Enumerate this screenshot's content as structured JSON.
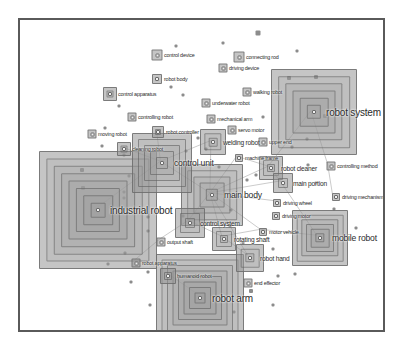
{
  "figure": {
    "type": "network-density-map",
    "title": "",
    "border_color": "#5a5a5a",
    "background_color": "#ffffff",
    "node_fill_color": "#969696",
    "node_outline_color": "#696969",
    "label_color": "#2b2b2b",
    "marker_color": "#787878",
    "link_color": "#b4b4b4"
  },
  "chart_data": {
    "type": "scatter",
    "title": "",
    "xlabel": "",
    "ylabel": "",
    "grid": false,
    "legend": "none",
    "xlim": [
      0,
      367
    ],
    "ylim": [
      0,
      314
    ],
    "nodes": [
      {
        "label": "industrial robot",
        "x": 78,
        "y": 190,
        "size": 118,
        "rings": 7,
        "label_size": "xl",
        "label_dx": 12,
        "label_dy": 0
      },
      {
        "label": "robot system",
        "x": 294,
        "y": 92,
        "size": 86,
        "rings": 5,
        "label_size": "xl",
        "label_dx": 12,
        "label_dy": 0
      },
      {
        "label": "robot arm",
        "x": 180,
        "y": 278,
        "size": 88,
        "rings": 7,
        "label_size": "xl",
        "label_dx": 12,
        "label_dy": 0
      },
      {
        "label": "main body",
        "x": 192,
        "y": 175,
        "size": 62,
        "rings": 4,
        "label_size": "l",
        "label_dx": 12,
        "label_dy": 0
      },
      {
        "label": "control unit",
        "x": 142,
        "y": 143,
        "size": 60,
        "rings": 4,
        "label_size": "l",
        "label_dx": 12,
        "label_dy": 0
      },
      {
        "label": "mobile robot",
        "x": 300,
        "y": 218,
        "size": 56,
        "rings": 5,
        "label_size": "l",
        "label_dx": 12,
        "label_dy": 0
      },
      {
        "label": "control system",
        "x": 170,
        "y": 203,
        "size": 30,
        "rings": 2,
        "label_size": "m",
        "label_dx": 10,
        "label_dy": 0
      },
      {
        "label": "robot hand",
        "x": 230,
        "y": 238,
        "size": 28,
        "rings": 2,
        "label_size": "m",
        "label_dx": 10,
        "label_dy": 0
      },
      {
        "label": "rotating shaft",
        "x": 204,
        "y": 219,
        "size": 24,
        "rings": 2,
        "label_size": "m",
        "label_dx": 10,
        "label_dy": 0
      },
      {
        "label": "robot cleaner",
        "x": 251,
        "y": 148,
        "size": 24,
        "rings": 2,
        "label_size": "m",
        "label_dx": 10,
        "label_dy": 0
      },
      {
        "label": "welding robot",
        "x": 193,
        "y": 122,
        "size": 26,
        "rings": 2,
        "label_size": "m",
        "label_dx": 10,
        "label_dy": 0
      },
      {
        "label": "main portion",
        "x": 263,
        "y": 163,
        "size": 20,
        "rings": 1,
        "label_size": "m",
        "label_dx": 10,
        "label_dy": 0
      },
      {
        "label": "humanoid robot",
        "x": 148,
        "y": 256,
        "size": 16,
        "rings": 1,
        "label_size": "s",
        "label_dx": 9,
        "label_dy": 0
      },
      {
        "label": "cleaning robot",
        "x": 104,
        "y": 129,
        "size": 14,
        "rings": 1,
        "label_size": "s",
        "label_dx": 8,
        "label_dy": 0
      },
      {
        "label": "control apparatus",
        "x": 90,
        "y": 74,
        "size": 14,
        "rings": 1,
        "label_size": "s",
        "label_dx": 8,
        "label_dy": 0
      },
      {
        "label": "robot controller",
        "x": 138,
        "y": 112,
        "size": 12,
        "rings": 1,
        "label_size": "s",
        "label_dx": 8,
        "label_dy": 0
      },
      {
        "label": "control device",
        "x": 137,
        "y": 35,
        "size": 11,
        "rings": 0,
        "label_size": "s",
        "label_dx": 7,
        "label_dy": 0
      },
      {
        "label": "connecting rod",
        "x": 219,
        "y": 37,
        "size": 11,
        "rings": 0,
        "label_size": "s",
        "label_dx": 7,
        "label_dy": 0
      },
      {
        "label": "robot body",
        "x": 137,
        "y": 59,
        "size": 10,
        "rings": 0,
        "label_size": "s",
        "label_dx": 7,
        "label_dy": 0
      },
      {
        "label": "driving device",
        "x": 203,
        "y": 48,
        "size": 9,
        "rings": 0,
        "label_size": "s",
        "label_dx": 6,
        "label_dy": 0
      },
      {
        "label": "walking robot",
        "x": 227,
        "y": 72,
        "size": 9,
        "rings": 0,
        "label_size": "s",
        "label_dx": 6,
        "label_dy": 0
      },
      {
        "label": "underwater robot",
        "x": 186,
        "y": 83,
        "size": 9,
        "rings": 0,
        "label_size": "s",
        "label_dx": 6,
        "label_dy": 0
      },
      {
        "label": "mechanical arm",
        "x": 191,
        "y": 99,
        "size": 9,
        "rings": 0,
        "label_size": "s",
        "label_dx": 6,
        "label_dy": 0
      },
      {
        "label": "controlling robot",
        "x": 112,
        "y": 97,
        "size": 9,
        "rings": 0,
        "label_size": "s",
        "label_dx": 6,
        "label_dy": 0
      },
      {
        "label": "moving robot",
        "x": 72,
        "y": 114,
        "size": 9,
        "rings": 0,
        "label_size": "s",
        "label_dx": 6,
        "label_dy": 0
      },
      {
        "label": "servo motor",
        "x": 212,
        "y": 110,
        "size": 9,
        "rings": 0,
        "label_size": "s",
        "label_dx": 6,
        "label_dy": 0
      },
      {
        "label": "upper end",
        "x": 243,
        "y": 122,
        "size": 9,
        "rings": 0,
        "label_size": "s",
        "label_dx": 6,
        "label_dy": 0
      },
      {
        "label": "machine frame",
        "x": 219,
        "y": 138,
        "size": 8,
        "rings": 0,
        "label_size": "s",
        "label_dx": 6,
        "label_dy": 0
      },
      {
        "label": "controlling method",
        "x": 311,
        "y": 146,
        "size": 9,
        "rings": 0,
        "label_size": "s",
        "label_dx": 6,
        "label_dy": 0
      },
      {
        "label": "driving mechanism",
        "x": 316,
        "y": 177,
        "size": 8,
        "rings": 0,
        "label_size": "s",
        "label_dx": 6,
        "label_dy": 0
      },
      {
        "label": "driving wheel",
        "x": 257,
        "y": 183,
        "size": 8,
        "rings": 0,
        "label_size": "s",
        "label_dx": 6,
        "label_dy": 0
      },
      {
        "label": "driving motor",
        "x": 256,
        "y": 196,
        "size": 8,
        "rings": 0,
        "label_size": "s",
        "label_dx": 6,
        "label_dy": 0
      },
      {
        "label": "motor vehicle",
        "x": 243,
        "y": 212,
        "size": 8,
        "rings": 0,
        "label_size": "s",
        "label_dx": 6,
        "label_dy": 0
      },
      {
        "label": "output shaft",
        "x": 141,
        "y": 222,
        "size": 9,
        "rings": 0,
        "label_size": "s",
        "label_dx": 6,
        "label_dy": 0
      },
      {
        "label": "robot apparatus",
        "x": 116,
        "y": 243,
        "size": 9,
        "rings": 0,
        "label_size": "s",
        "label_dx": 6,
        "label_dy": 0
      },
      {
        "label": "end effector",
        "x": 228,
        "y": 263,
        "size": 9,
        "rings": 0,
        "label_size": "s",
        "label_dx": 6,
        "label_dy": 0
      }
    ],
    "markers": [
      {
        "x": 238,
        "y": 13,
        "size": 5
      },
      {
        "x": 203,
        "y": 23,
        "size": 3
      },
      {
        "x": 156,
        "y": 26,
        "size": 3
      },
      {
        "x": 277,
        "y": 31,
        "size": 3
      },
      {
        "x": 269,
        "y": 58,
        "size": 4
      },
      {
        "x": 296,
        "y": 57,
        "size": 4
      },
      {
        "x": 151,
        "y": 67,
        "size": 3
      },
      {
        "x": 163,
        "y": 75,
        "size": 3
      },
      {
        "x": 99,
        "y": 86,
        "size": 3
      },
      {
        "x": 243,
        "y": 97,
        "size": 3
      },
      {
        "x": 85,
        "y": 108,
        "size": 3
      },
      {
        "x": 287,
        "y": 119,
        "size": 3
      },
      {
        "x": 82,
        "y": 126,
        "size": 3
      },
      {
        "x": 166,
        "y": 131,
        "size": 3
      },
      {
        "x": 186,
        "y": 129,
        "size": 3
      },
      {
        "x": 272,
        "y": 127,
        "size": 3
      },
      {
        "x": 199,
        "y": 147,
        "size": 3
      },
      {
        "x": 236,
        "y": 155,
        "size": 3
      },
      {
        "x": 288,
        "y": 145,
        "size": 3
      },
      {
        "x": 109,
        "y": 156,
        "size": 3
      },
      {
        "x": 62,
        "y": 150,
        "size": 4
      },
      {
        "x": 104,
        "y": 135,
        "size": 3
      },
      {
        "x": 296,
        "y": 163,
        "size": 3
      },
      {
        "x": 104,
        "y": 172,
        "size": 3
      },
      {
        "x": 211,
        "y": 190,
        "size": 3
      },
      {
        "x": 104,
        "y": 178,
        "size": 3
      },
      {
        "x": 128,
        "y": 197,
        "size": 3
      },
      {
        "x": 210,
        "y": 206,
        "size": 3
      },
      {
        "x": 128,
        "y": 211,
        "size": 3
      },
      {
        "x": 163,
        "y": 196,
        "size": 3
      },
      {
        "x": 253,
        "y": 229,
        "size": 3
      },
      {
        "x": 223,
        "y": 223,
        "size": 3
      },
      {
        "x": 105,
        "y": 233,
        "size": 3
      },
      {
        "x": 88,
        "y": 244,
        "size": 3
      },
      {
        "x": 128,
        "y": 252,
        "size": 3
      },
      {
        "x": 231,
        "y": 271,
        "size": 4
      },
      {
        "x": 258,
        "y": 256,
        "size": 3
      },
      {
        "x": 275,
        "y": 254,
        "size": 3
      },
      {
        "x": 214,
        "y": 292,
        "size": 3
      },
      {
        "x": 253,
        "y": 285,
        "size": 3
      },
      {
        "x": 130,
        "y": 285,
        "size": 3
      },
      {
        "x": 111,
        "y": 262,
        "size": 3
      },
      {
        "x": 305,
        "y": 96,
        "size": 4
      },
      {
        "x": 314,
        "y": 189,
        "size": 3
      },
      {
        "x": 336,
        "y": 208,
        "size": 3
      },
      {
        "x": 63,
        "y": 168,
        "size": 4
      },
      {
        "x": 178,
        "y": 118,
        "size": 3
      },
      {
        "x": 227,
        "y": 160,
        "size": 3
      }
    ],
    "links": [
      [
        142,
        143,
        192,
        175
      ],
      [
        192,
        175,
        251,
        148
      ],
      [
        192,
        175,
        170,
        203
      ],
      [
        192,
        175,
        204,
        219
      ],
      [
        251,
        148,
        263,
        163
      ],
      [
        192,
        175,
        263,
        163
      ],
      [
        193,
        122,
        142,
        143
      ],
      [
        193,
        122,
        192,
        175
      ],
      [
        204,
        219,
        230,
        238
      ],
      [
        170,
        203,
        141,
        222
      ],
      [
        141,
        222,
        116,
        243
      ],
      [
        192,
        175,
        257,
        183
      ],
      [
        192,
        175,
        243,
        212
      ],
      [
        251,
        148,
        294,
        92
      ],
      [
        219,
        138,
        251,
        148
      ],
      [
        294,
        92,
        311,
        146
      ],
      [
        204,
        219,
        243,
        212
      ],
      [
        180,
        278,
        148,
        256
      ],
      [
        170,
        203,
        204,
        219
      ],
      [
        142,
        143,
        104,
        129
      ],
      [
        138,
        112,
        142,
        143
      ],
      [
        192,
        175,
        230,
        238
      ],
      [
        263,
        163,
        300,
        218
      ],
      [
        243,
        212,
        300,
        218
      ],
      [
        78,
        190,
        142,
        143
      ],
      [
        192,
        175,
        219,
        138
      ],
      [
        311,
        146,
        316,
        177
      ]
    ]
  }
}
